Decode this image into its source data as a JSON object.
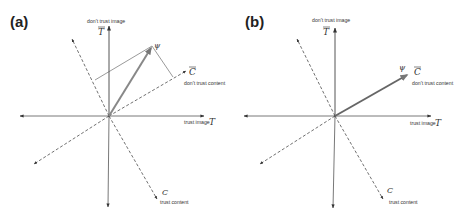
{
  "figure": {
    "panels": [
      {
        "id": "a",
        "label": "(a)",
        "axes": {
          "T_bar": {
            "symbol": "T",
            "overline": true,
            "caption": "don't trust image"
          },
          "T": {
            "symbol": "T",
            "caption": "trust image"
          },
          "C_bar": {
            "symbol": "C",
            "overline": true,
            "caption": "don't trust content"
          },
          "C": {
            "symbol": "C",
            "caption": "trust content"
          }
        },
        "state": {
          "symbol": "ψ",
          "direction": "between T̄ and C̄",
          "projections_shown": true
        }
      },
      {
        "id": "b",
        "label": "(b)",
        "axes": {
          "T_bar": {
            "symbol": "T",
            "overline": true,
            "caption": "don't trust image"
          },
          "T": {
            "symbol": "T",
            "caption": "trust image"
          },
          "C_bar": {
            "symbol": "C",
            "overline": true,
            "caption": "don't trust content"
          },
          "C": {
            "symbol": "C",
            "caption": "trust content"
          }
        },
        "state": {
          "symbol": "ψ",
          "direction": "aligned with C̄",
          "projections_shown": false
        }
      }
    ]
  },
  "colors": {
    "axis": "#444444",
    "dashed_axis": "#333333",
    "state_vector": "#777777",
    "projection": "#555555"
  }
}
